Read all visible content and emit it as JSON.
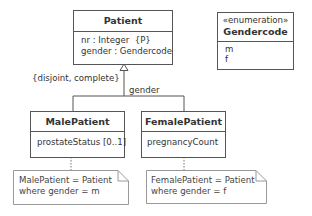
{
  "classes": {
    "patient": {
      "name": "Patient",
      "attributes": [
        "nr : Integer  {P}",
        "gender : Gendercode"
      ]
    },
    "gendercode": {
      "stereotype": "«enumeration»",
      "name": "Gendercode",
      "literals": [
        "m",
        "f"
      ]
    },
    "male": {
      "name": "MalePatient",
      "attributes": [
        "prostateStatus [0..1]"
      ]
    },
    "female": {
      "name": "FemalePatient",
      "attributes": [
        "pregnancyCount"
      ]
    }
  },
  "generalization": {
    "constraint": "{disjoint, complete}",
    "discriminator": "gender"
  },
  "notes": {
    "male": [
      "MalePatient = Patient",
      "where gender = m"
    ],
    "female": [
      "FemalePatient = Patient",
      "where gender = f"
    ]
  },
  "colors": {
    "line": "#555555",
    "text": "#333333",
    "background": "#ffffff"
  }
}
